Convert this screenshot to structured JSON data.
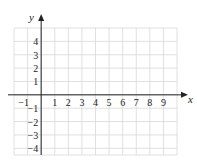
{
  "chart_data": {
    "type": "scatter",
    "title": "",
    "xlabel": "x",
    "ylabel": "y",
    "xlim": [
      -2,
      10
    ],
    "ylim": [
      -4.5,
      5
    ],
    "grid": true,
    "x_ticks": [
      -1,
      1,
      2,
      3,
      4,
      5,
      6,
      7,
      8,
      9
    ],
    "y_ticks": [
      4,
      3,
      2,
      1,
      -1,
      -2,
      -3,
      -4
    ],
    "x_tick_labels": [
      "−1",
      "1",
      "2",
      "3",
      "4",
      "5",
      "6",
      "7",
      "8",
      "9"
    ],
    "y_tick_labels": [
      "4",
      "3",
      "2",
      "1",
      "−1",
      "−2",
      "−3",
      "−4"
    ],
    "points": [],
    "colors": {
      "grid": "#d8d8d8",
      "axis": "#222222"
    }
  }
}
